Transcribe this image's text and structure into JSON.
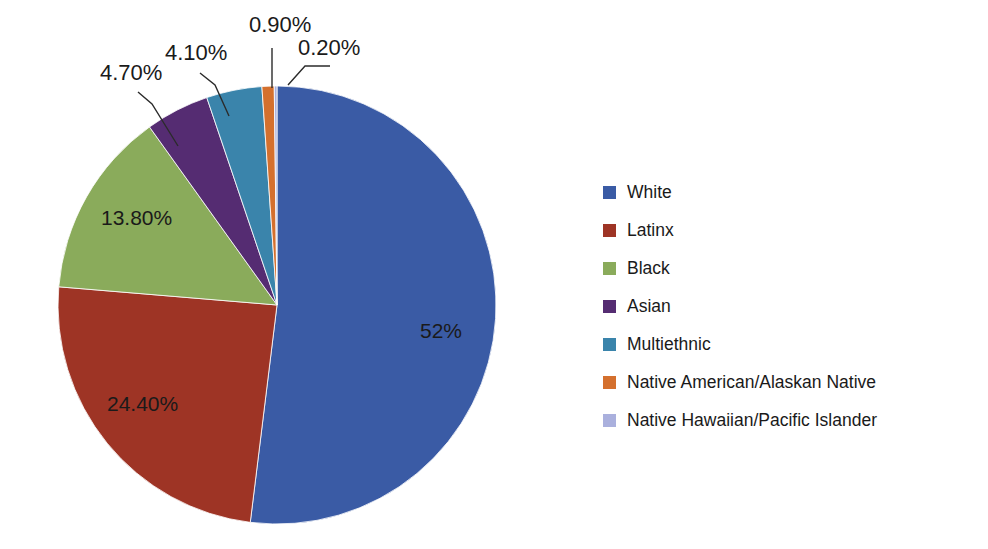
{
  "chart_data": {
    "type": "pie",
    "title": "",
    "subtitle": "",
    "xlabel": "",
    "ylabel": "",
    "grid": false,
    "legend_position": "right",
    "start_angle_clock": "12 o'clock",
    "direction": "clockwise",
    "categories": [
      "White",
      "Latinx",
      "Black",
      "Asian",
      "Multiethnic",
      "Native American/Alaskan Native",
      "Native Hawaiian/Pacific Islander"
    ],
    "values": [
      52.0,
      24.4,
      13.8,
      4.7,
      4.1,
      0.9,
      0.2
    ],
    "labels": [
      "52%",
      "24.40%",
      "13.80%",
      "4.70%",
      "4.10%",
      "0.90%",
      "0.20%"
    ],
    "colors": [
      "#3a5ba5",
      "#9e3425",
      "#8aab5b",
      "#552c72",
      "#3a84ab",
      "#d4702e",
      "#aab0dd"
    ],
    "slices": [
      {
        "name": "White",
        "value": 52.0,
        "label": "52%",
        "color": "#3a5ba5",
        "label_placement": "inside"
      },
      {
        "name": "Latinx",
        "value": 24.4,
        "label": "24.40%",
        "color": "#9e3425",
        "label_placement": "inside"
      },
      {
        "name": "Black",
        "value": 13.8,
        "label": "13.80%",
        "color": "#8aab5b",
        "label_placement": "inside"
      },
      {
        "name": "Asian",
        "value": 4.7,
        "label": "4.70%",
        "color": "#552c72",
        "label_placement": "outside-leader"
      },
      {
        "name": "Multiethnic",
        "value": 4.1,
        "label": "4.10%",
        "color": "#3a84ab",
        "label_placement": "outside-leader"
      },
      {
        "name": "Native American/Alaskan Native",
        "value": 0.9,
        "label": "0.90%",
        "color": "#d4702e",
        "label_placement": "outside-leader"
      },
      {
        "name": "Native Hawaiian/Pacific Islander",
        "value": 0.2,
        "label": "0.20%",
        "color": "#aab0dd",
        "label_placement": "outside-leader"
      }
    ]
  },
  "legend": {
    "items": [
      {
        "label": "White",
        "color": "#3a5ba5"
      },
      {
        "label": "Latinx",
        "color": "#9e3425"
      },
      {
        "label": "Black",
        "color": "#8aab5b"
      },
      {
        "label": "Asian",
        "color": "#552c72"
      },
      {
        "label": "Multiethnic",
        "color": "#3a84ab"
      },
      {
        "label": "Native American/Alaskan Native",
        "color": "#d4702e"
      },
      {
        "label": "Native Hawaiian/Pacific Islander",
        "color": "#aab0dd"
      }
    ]
  },
  "callouts": [
    {
      "label": "4.70%",
      "x": 100,
      "y": 80
    },
    {
      "label": "4.10%",
      "x": 165,
      "y": 60
    },
    {
      "label": "0.90%",
      "x": 249,
      "y": 32
    },
    {
      "label": "0.20%",
      "x": 298,
      "y": 55
    }
  ],
  "inside_labels": [
    {
      "label": "13.80%",
      "x": 101,
      "y": 225
    },
    {
      "label": "24.40%",
      "x": 107,
      "y": 411
    },
    {
      "label": "52%",
      "x": 420,
      "y": 338
    }
  ]
}
